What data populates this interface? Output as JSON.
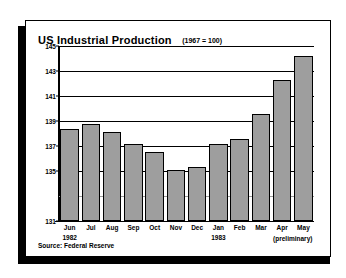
{
  "card": {
    "title": "US Industrial Production",
    "subtitle": "(1967 = 100)",
    "source": "Source: Federal Reserve",
    "prelim_note": "(preliminary)",
    "bar_color": "#9e9e9e",
    "bar_border_color": "#000000",
    "axis_color": "#000000",
    "background": "#ffffff"
  },
  "chart_data": {
    "type": "bar",
    "title": "US Industrial Production",
    "subtitle": "(1967 = 100)",
    "xlabel": "",
    "ylabel": "",
    "ylim": [
      131,
      145
    ],
    "grid": true,
    "legend": null,
    "source": "Source: Federal Reserve",
    "yticks": [
      131,
      135,
      137,
      139,
      141,
      143,
      145
    ],
    "ytick_labels": [
      "131",
      "135",
      "137",
      "139",
      "141",
      "143",
      "145"
    ],
    "gridlines": [
      133,
      135,
      137,
      139,
      141,
      143,
      145
    ],
    "categories": [
      "Jun",
      "Jul",
      "Aug",
      "Sep",
      "Oct",
      "Nov",
      "Dec",
      "Jan",
      "Feb",
      "Mar",
      "Apr",
      "May"
    ],
    "category_years": [
      "1982",
      "",
      "",
      "",
      "",
      "",
      "",
      "1983",
      "",
      "",
      "",
      ""
    ],
    "values": [
      138.4,
      138.8,
      138.1,
      137.2,
      136.5,
      135.1,
      135.3,
      137.2,
      137.6,
      139.6,
      142.3,
      144.2
    ],
    "annotations": [
      {
        "text": "(preliminary)",
        "applies_to": [
          "Apr",
          "May"
        ]
      }
    ]
  }
}
